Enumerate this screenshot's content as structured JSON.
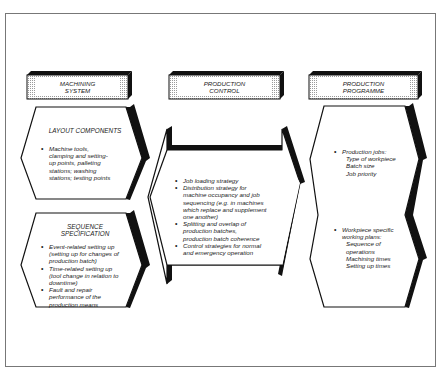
{
  "headers": {
    "machining_system": [
      "MACHINING",
      "SYSTEM"
    ],
    "production_control": [
      "PRODUCTION",
      "CONTROL"
    ],
    "production_programme": [
      "PRODUCTION",
      "PROGRAMME"
    ]
  },
  "machining_system": {
    "layout_components": {
      "title": "LAYOUT COMPONENTS",
      "items": [
        "Machine tools, clamping and setting-up points, palleting stations; washing stations; testing points"
      ]
    },
    "sequence_specification": {
      "title_line1": "SEQUENCE",
      "title_line2": "SPECIFICATION",
      "items": [
        "Event-related setting up (setting up for changes of production batch)",
        "Time-related setting up (tool change in relation to downtime)",
        "Fault and repair performance of the production means"
      ]
    }
  },
  "production_control": {
    "items": [
      "Job loading strategy",
      "Distribution strategy for machine occupancy and job sequencing (e.g. in machines which replace and supplement one another)",
      "Splitting and overlap of production batches, production batch coherence",
      "Control strategies for normal and emergency operation"
    ]
  },
  "production_programme": {
    "jobs": {
      "label": "Production jobs:",
      "sub": [
        "Type of workpiece",
        "Batch size",
        "Job priority"
      ]
    },
    "plans": {
      "label": "Workpiece specific working plans:",
      "sub": [
        "Sequence of operations",
        "Machining times",
        "Setting up times"
      ]
    }
  }
}
